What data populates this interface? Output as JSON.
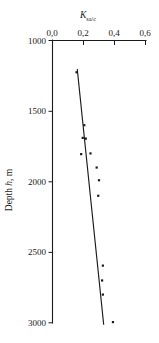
{
  "chart_data": {
    "type": "scatter",
    "title": "",
    "xlabel": "K_sa/c",
    "xlabel_main": "K",
    "xlabel_sub": "sa/c",
    "ylabel": "Depth h, m",
    "ylabel_prefix": "Depth ",
    "ylabel_italic": "h",
    "ylabel_suffix": ", m",
    "xlim": [
      0.0,
      0.6
    ],
    "ylim": [
      1000,
      3000
    ],
    "y_inverted": true,
    "grid": false,
    "legend": null,
    "xticks": [
      0.0,
      0.2,
      0.4,
      0.6
    ],
    "xtick_labels": [
      "0,0",
      "0,2",
      "0,4",
      "0,6"
    ],
    "yticks": [
      1000,
      1500,
      2000,
      2500,
      3000
    ],
    "ytick_labels": [
      "1000",
      "1500",
      "2000",
      "2500",
      "3000"
    ],
    "x_axis_position": "top",
    "y_axis_position": "left",
    "decimal_separator": ",",
    "marker": "square",
    "marker_color": "#1a1a1a",
    "points": [
      {
        "x": 0.155,
        "depth": 1225
      },
      {
        "x": 0.205,
        "depth": 1600
      },
      {
        "x": 0.195,
        "depth": 1690
      },
      {
        "x": 0.215,
        "depth": 1695
      },
      {
        "x": 0.185,
        "depth": 1805
      },
      {
        "x": 0.245,
        "depth": 1800
      },
      {
        "x": 0.285,
        "depth": 1900
      },
      {
        "x": 0.3,
        "depth": 1990
      },
      {
        "x": 0.295,
        "depth": 2100
      },
      {
        "x": 0.325,
        "depth": 2595
      },
      {
        "x": 0.32,
        "depth": 2700
      },
      {
        "x": 0.325,
        "depth": 2800
      },
      {
        "x": 0.39,
        "depth": 2995
      }
    ],
    "series": [
      {
        "name": "K_sa/c measurements",
        "x": [
          0.155,
          0.205,
          0.195,
          0.215,
          0.185,
          0.245,
          0.285,
          0.3,
          0.295,
          0.325,
          0.32,
          0.325,
          0.39
        ],
        "y": [
          1225,
          1600,
          1690,
          1695,
          1805,
          1800,
          1900,
          1990,
          2100,
          2595,
          2700,
          2800,
          2995
        ]
      }
    ],
    "trend_line": {
      "type": "line",
      "x": [
        0.16,
        0.33
      ],
      "y": [
        1205,
        3010
      ]
    }
  }
}
